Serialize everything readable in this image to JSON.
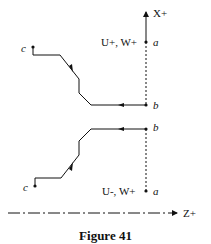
{
  "labels": {
    "x_axis": "X+",
    "z_axis": "Z+",
    "upper_direction": "U+, W+",
    "lower_direction": "U-, W+",
    "point_a": "a",
    "point_b": "b",
    "point_c": "c"
  },
  "caption": "Figure 41",
  "colors": {
    "line": "#111111",
    "background": "#ffffff"
  }
}
